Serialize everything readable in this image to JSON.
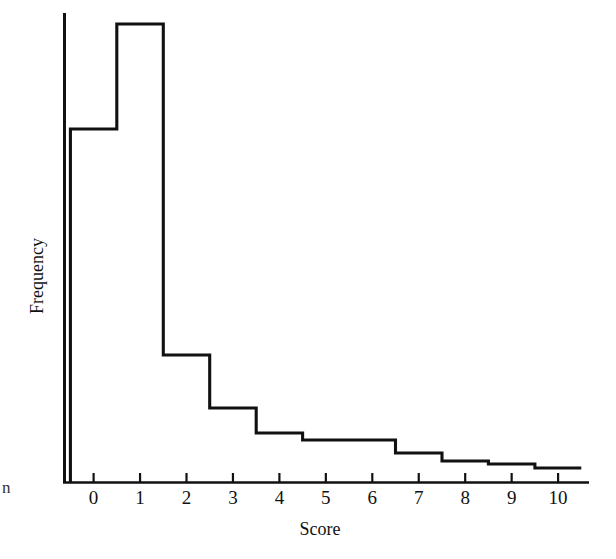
{
  "chart_data": {
    "type": "bar",
    "subtype": "histogram-outline",
    "title": "",
    "subtitle": "",
    "xlabel": "Score",
    "ylabel": "Frequency",
    "categories": [
      "0",
      "1",
      "2",
      "3",
      "4",
      "5",
      "6",
      "7",
      "8",
      "9",
      "10"
    ],
    "x": [
      0,
      1,
      2,
      3,
      4,
      5,
      6,
      7,
      8,
      9,
      10
    ],
    "values": [
      353,
      458,
      127,
      74,
      49,
      42,
      42,
      29,
      21,
      18,
      14
    ],
    "bin_edges": [
      -0.5,
      0.5,
      1.5,
      2.5,
      3.5,
      4.5,
      5.5,
      6.5,
      7.5,
      8.5,
      9.5,
      10.5
    ],
    "bin_width": 1,
    "xtick_labels": [
      "0",
      "1",
      "2",
      "3",
      "4",
      "5",
      "6",
      "7",
      "8",
      "9",
      "10"
    ],
    "ytick_labels": [],
    "xlim": [
      -0.65,
      10.65
    ],
    "ylim": [
      0,
      470
    ],
    "grid": false,
    "legend": false,
    "legend_position": "none",
    "annotations": [],
    "series": [
      {
        "name": "Frequency",
        "values": [
          353,
          458,
          127,
          74,
          49,
          42,
          42,
          29,
          21,
          18,
          14
        ]
      }
    ],
    "colors": {
      "line": "#111111",
      "axis": "#111111",
      "background": "#ffffff"
    }
  },
  "axes": {
    "x_title": "Score",
    "y_title": "Frequency"
  },
  "margin_mark": {
    "text": "n"
  }
}
